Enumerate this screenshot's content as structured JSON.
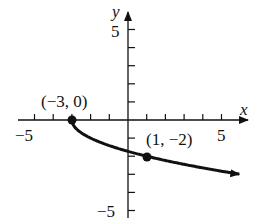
{
  "chart_data": {
    "type": "line",
    "function": "y = -sqrt(x + 3)",
    "x_axis_label": "x",
    "y_axis_label": "y",
    "xlim": [
      -6,
      6
    ],
    "ylim": [
      -5.5,
      6
    ],
    "x_ticks": [
      -5,
      -4,
      -3,
      -2,
      -1,
      1,
      2,
      3,
      4,
      5
    ],
    "y_ticks": [
      -5,
      -4,
      -3,
      -2,
      -1,
      1,
      2,
      3,
      4,
      5
    ],
    "x_tick_labels": {
      "-5": "−5",
      "5": "5"
    },
    "y_tick_labels": {
      "5": "5",
      "-5": "−5"
    },
    "grid": false,
    "curve_start": [
      -3,
      0
    ],
    "curve_end_arrow": true,
    "labeled_points": [
      {
        "x": -3,
        "y": 0,
        "label": "(−3, 0)"
      },
      {
        "x": 1,
        "y": -2,
        "label": "(1, −2)"
      }
    ],
    "color": "#111111"
  },
  "labels": {
    "x_axis": "x",
    "y_axis": "y",
    "x_neg5": "−5",
    "x_pos5": "5",
    "y_pos5": "5",
    "y_neg5": "−5",
    "point1": "(−3, 0)",
    "point2": "(1, −2)"
  }
}
